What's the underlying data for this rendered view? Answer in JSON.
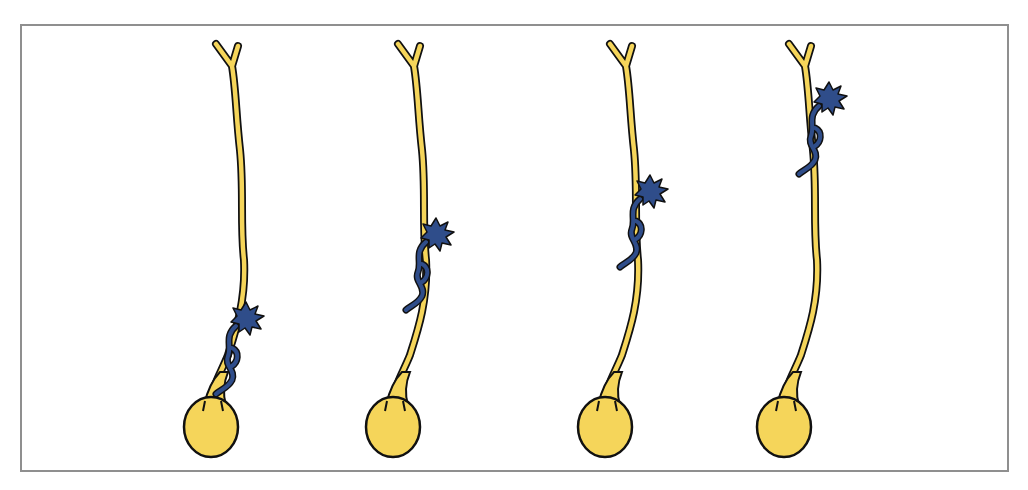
{
  "figure": {
    "colors": {
      "neuron_fill": "#f5d55a",
      "outline": "#111111",
      "migrating_cell": "#2f4d8a",
      "frame_border": "#8f8f8f",
      "background": "#ffffff"
    },
    "panels": [
      {
        "id": 1,
        "x_offset": 0,
        "cell_y": 318
      },
      {
        "id": 2,
        "x_offset": 182,
        "cell_y": 234
      },
      {
        "id": 3,
        "x_offset": 394,
        "cell_y": 191
      },
      {
        "id": 4,
        "x_offset": 573,
        "cell_y": 98
      }
    ]
  }
}
